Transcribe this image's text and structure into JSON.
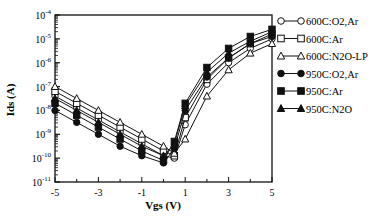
{
  "chart_data": {
    "type": "line",
    "title": "",
    "xlabel": "Vgs (V)",
    "ylabel": "Ids (A)",
    "xlim": [
      -5,
      5
    ],
    "ylim_log10": [
      -11,
      -4
    ],
    "yscale": "log",
    "grid": false,
    "legend_position": "right-outside",
    "x_ticks": [
      -5,
      -3,
      -1,
      1,
      3,
      5
    ],
    "x_tick_labels": [
      "-5",
      "-3",
      "-1",
      "1",
      "3",
      "5"
    ],
    "y_ticks_log10": [
      -4,
      -5,
      -6,
      -7,
      -8,
      -9,
      -10,
      -11
    ],
    "y_tick_labels": [
      {
        "base": "10",
        "exp": "-4"
      },
      {
        "base": "10",
        "exp": "-5"
      },
      {
        "base": "10",
        "exp": "-6"
      },
      {
        "base": "10",
        "exp": "-7"
      },
      {
        "base": "10",
        "exp": "-8"
      },
      {
        "base": "10",
        "exp": "-9"
      },
      {
        "base": "10",
        "exp": "-10"
      },
      {
        "base": "10",
        "exp": "-11"
      }
    ],
    "x": [
      -5,
      -4,
      -3,
      -2,
      -1,
      0,
      0.5,
      1,
      2,
      3,
      4,
      5
    ],
    "series": [
      {
        "name": "600C:O2,Ar",
        "marker": "circle-open",
        "values_log10": [
          -7.4,
          -7.9,
          -8.4,
          -8.9,
          -9.4,
          -9.9,
          -10.0,
          -8.6,
          -6.9,
          -6.0,
          -5.4,
          -5.0
        ]
      },
      {
        "name": "600C:Ar",
        "marker": "square-open",
        "values_log10": [
          -7.2,
          -7.7,
          -8.2,
          -8.7,
          -9.2,
          -9.7,
          -9.9,
          -8.3,
          -6.7,
          -5.8,
          -5.2,
          -4.8
        ]
      },
      {
        "name": "600C:N2O-LP",
        "marker": "triangle-open",
        "values_log10": [
          -7.0,
          -7.5,
          -8.0,
          -8.5,
          -9.0,
          -9.5,
          -9.8,
          -9.2,
          -7.4,
          -6.3,
          -5.6,
          -5.2
        ]
      },
      {
        "name": "950C:O2,Ar",
        "marker": "circle-filled",
        "values_log10": [
          -8.0,
          -8.5,
          -9.0,
          -9.5,
          -9.9,
          -10.2,
          -9.6,
          -8.0,
          -6.6,
          -5.8,
          -5.2,
          -4.9
        ]
      },
      {
        "name": "950C:Ar",
        "marker": "square-filled",
        "values_log10": [
          -7.7,
          -8.2,
          -8.7,
          -9.2,
          -9.7,
          -10.1,
          -9.3,
          -7.7,
          -6.2,
          -5.4,
          -4.9,
          -4.6
        ]
      },
      {
        "name": "950C:N2O",
        "marker": "triangle-filled",
        "values_log10": [
          -7.5,
          -8.0,
          -8.5,
          -9.0,
          -9.5,
          -9.9,
          -9.4,
          -7.8,
          -6.4,
          -5.6,
          -5.1,
          -4.7
        ]
      }
    ]
  },
  "legend": {
    "items": [
      {
        "label": "600C:O2,Ar",
        "marker": "circle-open"
      },
      {
        "label": "600C:Ar",
        "marker": "square-open"
      },
      {
        "label": "600C:N2O-LP",
        "marker": "triangle-open"
      },
      {
        "label": "950C:O2,Ar",
        "marker": "circle-filled"
      },
      {
        "label": "950C:Ar",
        "marker": "square-filled"
      },
      {
        "label": "950C:N2O",
        "marker": "triangle-filled"
      }
    ]
  },
  "axes": {
    "x_title": "Vgs (V)",
    "y_title": "Ids (A)"
  }
}
